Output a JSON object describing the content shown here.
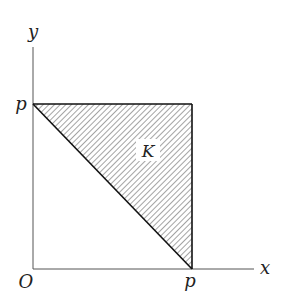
{
  "diagram": {
    "type": "region-plot",
    "axes": {
      "x_label": "x",
      "y_label": "y",
      "origin_label": "O"
    },
    "ticks": {
      "x_tick_label": "p",
      "y_tick_label": "p"
    },
    "region": {
      "label": "K",
      "shape": "triangle",
      "vertices": [
        [
          "0",
          "p"
        ],
        [
          "p",
          "p"
        ],
        [
          "p",
          "0"
        ]
      ],
      "fill": "hatched (diagonal lines)"
    },
    "colors": {
      "axis": "#555555",
      "edge": "#111111",
      "hatch": "#555555",
      "background": "#ffffff"
    }
  }
}
